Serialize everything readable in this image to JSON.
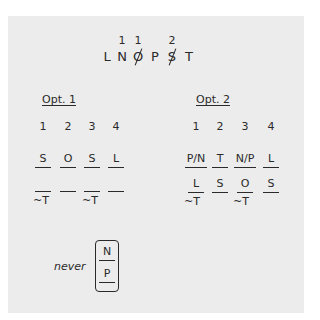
{
  "header": {
    "letters": [
      "L",
      "N",
      "O",
      "P",
      "S",
      "T"
    ],
    "crossed_out": [
      "O",
      "S"
    ],
    "counts": [
      {
        "above": "N",
        "value": "1"
      },
      {
        "above": "O",
        "value": "1"
      },
      {
        "above": "S",
        "value": "2"
      }
    ]
  },
  "options": [
    {
      "title": "Opt. 1",
      "positions": [
        "1",
        "2",
        "3",
        "4"
      ],
      "row1": [
        "S",
        "O",
        "S",
        "L"
      ],
      "row2": [
        "",
        "",
        "",
        ""
      ],
      "row2_notes": [
        "~T",
        "",
        "~T",
        ""
      ]
    },
    {
      "title": "Opt. 2",
      "positions": [
        "1",
        "2",
        "3",
        "4"
      ],
      "row1": [
        "P/N",
        "T",
        "N/P",
        "L"
      ],
      "row2": [
        "L",
        "S",
        "O",
        "S"
      ],
      "row2_notes": [
        "~T",
        "",
        "~T",
        ""
      ]
    }
  ],
  "rule": {
    "label": "never",
    "top": "N",
    "bottom": "P"
  }
}
